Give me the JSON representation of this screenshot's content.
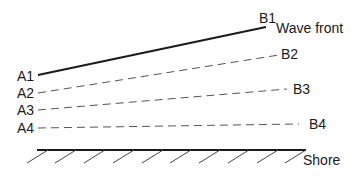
{
  "diagram": {
    "title_label": "Wave front",
    "shore_label": "Shore",
    "wavefronts": [
      {
        "start": "A1",
        "end": "B1",
        "style": "solid"
      },
      {
        "start": "A2",
        "end": "B2",
        "style": "dashed"
      },
      {
        "start": "A3",
        "end": "B3",
        "style": "dashed"
      },
      {
        "start": "A4",
        "end": "B4",
        "style": "dashed"
      }
    ],
    "colors": {
      "line": "#1a1a1a",
      "background": "#ffffff"
    }
  }
}
